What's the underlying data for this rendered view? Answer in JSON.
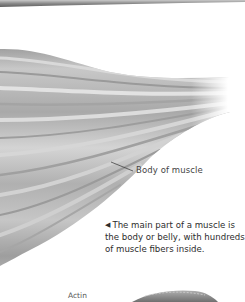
{
  "illustration": {
    "subject": "muscle-body",
    "colors": {
      "muscle_dark": "#8a8a8a",
      "muscle_mid": "#b5b5b5",
      "muscle_light": "#e6e6e6",
      "tube": "#7d7d7d",
      "actin": "#8f8f8f",
      "text": "#2d2d2d"
    }
  },
  "labels": {
    "body_of_muscle": "Body of muscle",
    "actin": "Actin"
  },
  "caption": {
    "arrow": "◀",
    "text": "The main part of a muscle is the body or belly, with hundreds of muscle fibers inside."
  }
}
